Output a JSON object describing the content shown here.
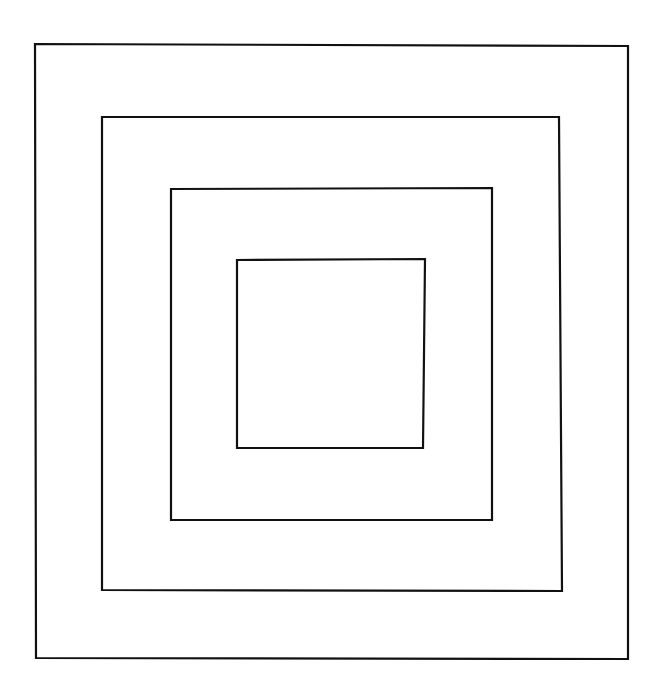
{
  "canvas": {
    "width": 662,
    "height": 693,
    "background": "#ffffff"
  },
  "diagram": {
    "title": "",
    "description": "Four concentric hand-drawn squares",
    "stroke_color": "#111111",
    "stroke_width": 2.2,
    "squares": [
      {
        "name": "outer-square",
        "points": [
          [
            35,
            44
          ],
          [
            628,
            46
          ],
          [
            628,
            659
          ],
          [
            36,
            658
          ]
        ]
      },
      {
        "name": "second-square",
        "points": [
          [
            102,
            117
          ],
          [
            559,
            117
          ],
          [
            562,
            591
          ],
          [
            102,
            590
          ]
        ]
      },
      {
        "name": "third-square",
        "points": [
          [
            171,
            189
          ],
          [
            492,
            188
          ],
          [
            492,
            520
          ],
          [
            171,
            520
          ]
        ]
      },
      {
        "name": "inner-square",
        "points": [
          [
            237,
            260
          ],
          [
            425,
            259
          ],
          [
            423,
            448
          ],
          [
            237,
            448
          ]
        ]
      }
    ]
  }
}
